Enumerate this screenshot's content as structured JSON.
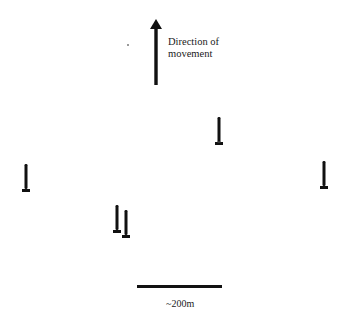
{
  "diagram": {
    "direction_label": {
      "line1": "Direction of",
      "line2": "movement"
    },
    "direction_arrow": {
      "icon": "up-arrow-icon",
      "color": "#111111"
    },
    "markers": [
      {
        "id": "marker-1",
        "icon": "marker-icon",
        "x": 219,
        "y_top": 118
      },
      {
        "id": "marker-2",
        "icon": "marker-icon",
        "x": 26,
        "y_top": 165
      },
      {
        "id": "marker-3",
        "icon": "marker-icon",
        "x": 324,
        "y_top": 162
      },
      {
        "id": "marker-4",
        "icon": "marker-icon",
        "x": 117,
        "y_top": 205
      },
      {
        "id": "marker-5",
        "icon": "marker-icon",
        "x": 126,
        "y_top": 211
      }
    ],
    "scale_bar": {
      "label": "~200m",
      "color": "#111111"
    }
  }
}
